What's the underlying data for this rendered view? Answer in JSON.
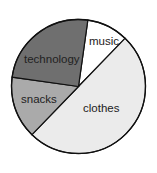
{
  "chart_data": {
    "type": "pie",
    "title": "",
    "start_angle_deg": 8,
    "direction": "clockwise",
    "categories": [
      "music",
      "clothes",
      "snacks",
      "technology"
    ],
    "values": [
      10,
      50,
      15,
      25
    ],
    "colors": [
      "#ffffff",
      "#ebebeb",
      "#aaaaaa",
      "#6f6f6f"
    ],
    "legend": "none",
    "labels_inside": true
  },
  "labels": {
    "music": "music",
    "clothes": "clothes",
    "snacks": "snacks",
    "technology": "technology"
  }
}
